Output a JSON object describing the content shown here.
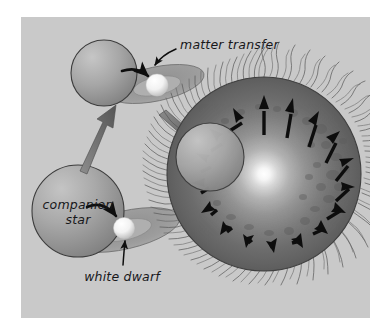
{
  "figure": {
    "panel_background": "#c9c9c9",
    "page_background": "#ffffff",
    "labels": {
      "matter_transfer": "matter transfer",
      "companion_star_line1": "companion",
      "companion_star_line2": "star",
      "white_dwarf": "white dwarf"
    },
    "colors": {
      "panel": "#c9c9c9",
      "star_fill_light": "#b6b6b6",
      "star_fill_dark": "#8e8e8e",
      "star_outline": "#3a3a3a",
      "disk_fill": "#9a9a9a",
      "disk_outline": "#6d6d6d",
      "white_dwarf_fill": "#ffffff",
      "stage_arrow": "#6b6b6b",
      "flow_arrow": "#111111",
      "leader_line": "#111111",
      "explosion_core": "#ffffff",
      "explosion_mid": "#9b9b9b",
      "explosion_edge": "#5e5e5e",
      "filament": "#5a5a5a",
      "shock_arrow": "#0d0d0d",
      "text": "#17171a"
    },
    "stages": [
      {
        "name": "stage-1-binary-pair",
        "description": "Companion star beside a white dwarf surrounded by an accretion disk",
        "elements": [
          "companion-star",
          "accretion-disk",
          "white-dwarf",
          "matter-flow-arrow"
        ]
      },
      {
        "name": "stage-2-binary-pair-transfer",
        "description": "Companion star transfers matter onto the white dwarf accretion disk",
        "elements": [
          "companion-star",
          "accretion-disk",
          "white-dwarf",
          "matter-flow-arrow"
        ]
      },
      {
        "name": "stage-3-supernova-explosion",
        "description": "White dwarf detonates as a supernova with outward shock arrows and filaments",
        "elements": [
          "explosion-sphere",
          "shock-arrows",
          "filaments",
          "companion-star"
        ]
      }
    ],
    "stage_arrows": [
      {
        "name": "arrow-stage1-to-stage2",
        "direction": "up-right"
      },
      {
        "name": "arrow-stage2-to-stage3",
        "direction": "down-right"
      }
    ],
    "counts": {
      "shock_arrows": 16,
      "filaments": 96
    }
  }
}
